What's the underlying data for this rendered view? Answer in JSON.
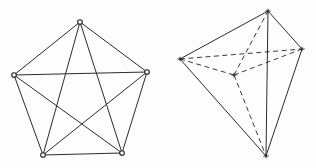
{
  "figure": {
    "background_color": "#fdfdfd",
    "solid_line_color": "#2b2b2b",
    "hidden_line_color": "#3a3a3a",
    "vertex_fill_color": "#ffffff",
    "vertex_stroke_color": "#222222",
    "line_width": 1,
    "hidden_dash_pattern": "5 3.5"
  },
  "left_figure": {
    "name": "complete-graph-pentagon",
    "description": "Regular pentagon with all five vertices joined, forming a complete graph K5 with an inscribed pentagram",
    "vertex_count": 5,
    "edge_count": 10,
    "vertex_marker": "small open circle",
    "vertices": [
      {
        "id": "A",
        "label": "top",
        "x": 80,
        "y": 22
      },
      {
        "id": "B",
        "label": "right",
        "x": 147,
        "y": 72
      },
      {
        "id": "C",
        "label": "bottom-right",
        "x": 122,
        "y": 153
      },
      {
        "id": "D",
        "label": "bottom-left",
        "x": 43,
        "y": 155
      },
      {
        "id": "E",
        "label": "left",
        "x": 14,
        "y": 75
      }
    ],
    "edges": [
      {
        "from": "A",
        "to": "B",
        "style": "solid",
        "kind": "perimeter"
      },
      {
        "from": "B",
        "to": "C",
        "style": "solid",
        "kind": "perimeter"
      },
      {
        "from": "C",
        "to": "D",
        "style": "solid",
        "kind": "perimeter"
      },
      {
        "from": "D",
        "to": "E",
        "style": "solid",
        "kind": "perimeter"
      },
      {
        "from": "E",
        "to": "A",
        "style": "solid",
        "kind": "perimeter"
      },
      {
        "from": "A",
        "to": "C",
        "style": "solid",
        "kind": "diagonal"
      },
      {
        "from": "A",
        "to": "D",
        "style": "solid",
        "kind": "diagonal"
      },
      {
        "from": "B",
        "to": "D",
        "style": "solid",
        "kind": "diagonal"
      },
      {
        "from": "B",
        "to": "E",
        "style": "solid",
        "kind": "diagonal"
      },
      {
        "from": "C",
        "to": "E",
        "style": "solid",
        "kind": "diagonal"
      }
    ]
  },
  "right_figure": {
    "name": "triangular-bipyramid",
    "description": "Triangular bipyramid drawn in perspective with the rear vertex and its three edges shown as hidden dashed lines",
    "vertex_count": 5,
    "edge_count": 9,
    "vertex_marker": "small cross tick",
    "vertices": [
      {
        "id": "T",
        "label": "apex-top",
        "x": 268,
        "y": 11,
        "hidden": false
      },
      {
        "id": "L",
        "label": "left",
        "x": 180,
        "y": 59,
        "hidden": false
      },
      {
        "id": "R",
        "label": "right",
        "x": 302,
        "y": 49,
        "hidden": false
      },
      {
        "id": "H",
        "label": "rear-hidden",
        "x": 234,
        "y": 75,
        "hidden": true
      },
      {
        "id": "B",
        "label": "apex-bottom",
        "x": 266,
        "y": 156,
        "hidden": false
      }
    ],
    "edges": [
      {
        "from": "T",
        "to": "L",
        "style": "solid",
        "kind": "upper-front"
      },
      {
        "from": "T",
        "to": "R",
        "style": "solid",
        "kind": "upper-front"
      },
      {
        "from": "T",
        "to": "B",
        "style": "solid",
        "kind": "vertical-axis"
      },
      {
        "from": "L",
        "to": "B",
        "style": "solid",
        "kind": "lower-front"
      },
      {
        "from": "R",
        "to": "B",
        "style": "solid",
        "kind": "lower-front"
      },
      {
        "from": "L",
        "to": "R",
        "style": "hidden",
        "kind": "equator-back"
      },
      {
        "from": "L",
        "to": "H",
        "style": "hidden",
        "kind": "equator-back"
      },
      {
        "from": "H",
        "to": "R",
        "style": "hidden",
        "kind": "equator-back"
      },
      {
        "from": "H",
        "to": "T",
        "style": "hidden",
        "kind": "to-apex-top"
      },
      {
        "from": "H",
        "to": "B",
        "style": "hidden",
        "kind": "to-apex-bottom"
      }
    ]
  }
}
